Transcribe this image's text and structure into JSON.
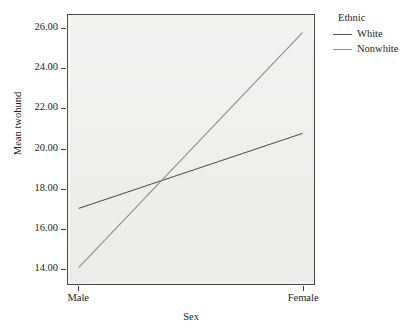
{
  "chart_data": {
    "type": "line",
    "title": "",
    "subtitle": "",
    "xlabel": "Sex",
    "ylabel": "Mean twohund",
    "categories": [
      "Male",
      "Female"
    ],
    "x": [
      0,
      1
    ],
    "series": [
      {
        "name": "White",
        "values": [
          17.0,
          20.75
        ],
        "color": "#555555"
      },
      {
        "name": "Nonwhite",
        "values": [
          14.05,
          25.8
        ],
        "color": "#8d8d8d"
      }
    ],
    "legend_title": "Ethnic",
    "legend_position": "right",
    "ylim": [
      13.2,
      26.7
    ],
    "yticks": [
      14.0,
      16.0,
      18.0,
      20.0,
      22.0,
      24.0,
      26.0
    ],
    "ytick_labels": [
      "14.00",
      "16.00",
      "18.00",
      "20.00",
      "22.00",
      "24.00",
      "26.00"
    ],
    "xtick_labels": [
      "Male",
      "Female"
    ],
    "grid": false,
    "panel_background": "#ededec",
    "figure_background": "#ffffff",
    "axis_color": "#3c3c3c",
    "annotations": []
  },
  "axes": {
    "y_title": "Mean twohund",
    "x_title": "Sex"
  },
  "legend": {
    "title": "Ethnic",
    "entries": [
      {
        "label": "White",
        "color": "#555555"
      },
      {
        "label": "Nonwhite",
        "color": "#8d8d8d"
      }
    ]
  }
}
